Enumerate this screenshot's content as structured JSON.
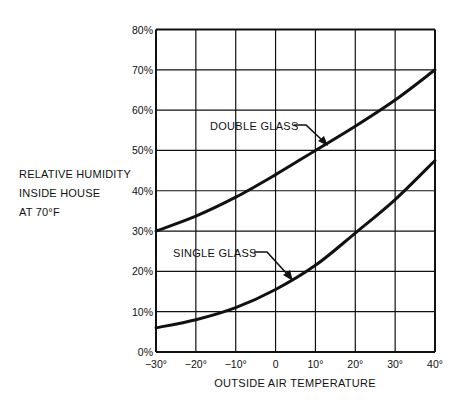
{
  "chart_data": {
    "type": "line",
    "title": "",
    "xlabel": "OUTSIDE AIR TEMPERATURE",
    "ylabel_lines": [
      "RELATIVE HUMIDITY",
      "INSIDE HOUSE",
      "AT 70°F"
    ],
    "ylabel": "RELATIVE HUMIDITY INSIDE HOUSE AT 70°F",
    "x_ticks": [
      -30,
      -20,
      -10,
      0,
      10,
      20,
      30,
      40
    ],
    "x_tick_labels": [
      "−30°",
      "−20°",
      "−10°",
      "0",
      "10°",
      "20°",
      "30°",
      "40°"
    ],
    "y_ticks": [
      0,
      10,
      20,
      30,
      40,
      50,
      60,
      70,
      80
    ],
    "y_tick_labels": [
      "0%",
      "10%",
      "20%",
      "30%",
      "40%",
      "50%",
      "60%",
      "70%",
      "80%"
    ],
    "xlim": [
      -30,
      40
    ],
    "ylim": [
      0,
      80
    ],
    "grid": true,
    "legend": "none (inline annotations with leader arrows)",
    "x": [
      -30,
      -20,
      -10,
      0,
      10,
      20,
      30,
      40
    ],
    "series": [
      {
        "name": "DOUBLE GLASS",
        "values": [
          30,
          33.7,
          38.4,
          44,
          50,
          56,
          62.5,
          70
        ]
      },
      {
        "name": "SINGLE GLASS",
        "values": [
          6,
          8,
          11,
          15.5,
          21.5,
          29.5,
          37.8,
          47.5
        ]
      }
    ],
    "annotations": [
      {
        "text": "DOUBLE GLASS",
        "points_to_x": 12,
        "series": "DOUBLE GLASS"
      },
      {
        "text": "SINGLE GLASS",
        "points_to_x": 4,
        "series": "SINGLE GLASS"
      }
    ]
  }
}
